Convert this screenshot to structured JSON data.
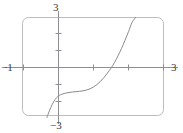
{
  "figure": {
    "name": "graphing-calculator-plot",
    "frame": {
      "border_color": "#bdbdbd",
      "corner_radius": 6,
      "x": 22,
      "y": 17,
      "width": 141,
      "height": 98
    },
    "axis_color": "#8f8f93",
    "curve_color": "#8a8a90",
    "label_color": "#3a3a3a"
  },
  "labels": {
    "x_min": "−1",
    "x_max": "3",
    "y_max": "3",
    "y_min": "−3"
  },
  "chart_data": {
    "type": "line",
    "title": "",
    "xlabel": "",
    "ylabel": "",
    "xlim": [
      -1,
      3
    ],
    "ylim": [
      -3,
      3
    ],
    "grid": false,
    "legend": null,
    "x_tick_labels": [
      "−1",
      "3"
    ],
    "y_tick_labels": [
      "3",
      "−3"
    ],
    "x_ticks": [
      0,
      1,
      2
    ],
    "y_ticks": [
      -2,
      -1,
      1,
      2
    ],
    "axes_shown": [
      "x-axis",
      "y-axis"
    ],
    "series": [
      {
        "name": "curve",
        "x": [
          -0.33,
          -0.3,
          -0.26,
          -0.22,
          -0.18,
          -0.14,
          -0.1,
          -0.06,
          -0.02,
          0.02,
          0.06,
          0.1,
          0.16,
          0.22,
          0.3,
          0.4,
          0.5,
          0.6,
          0.7,
          0.8,
          0.9,
          1.0,
          1.1,
          1.2,
          1.3,
          1.4,
          1.5,
          1.6,
          1.7,
          1.8,
          1.9,
          2.0,
          2.1,
          2.2
        ],
        "y": [
          -3.0,
          -2.82,
          -2.6,
          -2.4,
          -2.22,
          -2.06,
          -1.93,
          -1.82,
          -1.74,
          -1.68,
          -1.63,
          -1.6,
          -1.56,
          -1.53,
          -1.5,
          -1.47,
          -1.45,
          -1.43,
          -1.4,
          -1.35,
          -1.28,
          -1.17,
          -1.02,
          -0.83,
          -0.6,
          -0.33,
          -0.04,
          0.3,
          0.7,
          1.14,
          1.63,
          2.15,
          2.7,
          3.0
        ]
      }
    ]
  }
}
